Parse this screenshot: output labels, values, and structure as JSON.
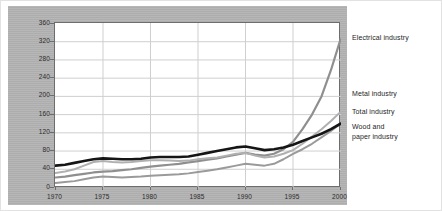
{
  "chart_data": {
    "type": "line",
    "title": "",
    "subtitle": "",
    "xlabel": "",
    "ylabel": "",
    "xlim": [
      1970,
      2000
    ],
    "ylim": [
      0,
      360
    ],
    "grid": true,
    "legend_position": "right",
    "y_ticks": [
      0,
      40,
      80,
      120,
      160,
      200,
      240,
      280,
      320,
      360
    ],
    "x_ticks": [
      1970,
      1975,
      1980,
      1985,
      1990,
      1995,
      2000
    ],
    "x": [
      1970,
      1971,
      1972,
      1973,
      1974,
      1975,
      1976,
      1977,
      1978,
      1979,
      1980,
      1981,
      1982,
      1983,
      1984,
      1985,
      1986,
      1987,
      1988,
      1989,
      1990,
      1991,
      1992,
      1993,
      1994,
      1995,
      1996,
      1997,
      1998,
      1999,
      2000
    ],
    "series": [
      {
        "name": "Electrical industry",
        "color": "#8f8f8f",
        "width": 2.2,
        "values": [
          22,
          24,
          27,
          30,
          33,
          35,
          36,
          38,
          40,
          43,
          46,
          48,
          50,
          52,
          55,
          58,
          61,
          64,
          68,
          72,
          76,
          72,
          70,
          74,
          84,
          100,
          128,
          160,
          200,
          258,
          325
        ]
      },
      {
        "name": "Metal industry",
        "color": "#b0b0b0",
        "width": 2.0,
        "values": [
          32,
          35,
          40,
          48,
          56,
          58,
          56,
          55,
          56,
          58,
          60,
          60,
          59,
          58,
          59,
          62,
          64,
          66,
          70,
          74,
          76,
          70,
          66,
          68,
          74,
          82,
          96,
          112,
          128,
          146,
          166
        ]
      },
      {
        "name": "Total industry",
        "color": "#151515",
        "width": 2.6,
        "values": [
          48,
          50,
          54,
          58,
          62,
          64,
          63,
          62,
          62,
          63,
          66,
          67,
          67,
          67,
          68,
          72,
          76,
          80,
          84,
          88,
          90,
          86,
          82,
          84,
          88,
          94,
          102,
          110,
          118,
          128,
          140
        ]
      },
      {
        "name": "Wood and\npaper industry",
        "color": "#9a9a9a",
        "width": 2.0,
        "values": [
          10,
          12,
          14,
          18,
          22,
          24,
          23,
          22,
          23,
          24,
          26,
          27,
          28,
          29,
          31,
          34,
          37,
          40,
          44,
          48,
          52,
          50,
          48,
          52,
          62,
          74,
          84,
          96,
          110,
          124,
          140
        ]
      }
    ]
  },
  "legend": {
    "items": [
      {
        "label": "Electrical industry",
        "top": 33
      },
      {
        "label": "Metal industry",
        "top": 89
      },
      {
        "label": "Total industry",
        "top": 107
      },
      {
        "label": "Wood and\npaper industry",
        "top": 122
      }
    ]
  },
  "colors": {
    "panel_background": "#b3b3b3",
    "plot_background": "#ffffff",
    "grid": "#cfcfcf",
    "axis": "#6d6d6d",
    "text": "#1d1d1d"
  }
}
